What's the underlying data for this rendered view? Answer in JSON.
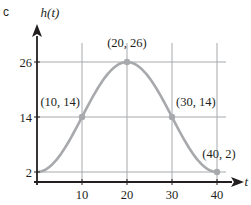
{
  "panel_label": "c",
  "chart_data": {
    "type": "line",
    "title": "",
    "xlabel": "t",
    "ylabel": "h(t)",
    "x_ticks": [
      10,
      20,
      30,
      40
    ],
    "y_ticks": [
      2,
      14,
      26
    ],
    "xlim": [
      0,
      44
    ],
    "ylim": [
      0,
      32
    ],
    "grid": true,
    "legend": null,
    "series": [
      {
        "name": "h(t)",
        "x": [
          0,
          10,
          20,
          30,
          40
        ],
        "values": [
          2,
          14,
          26,
          14,
          2
        ],
        "shape": "cosine curve, minimum at t=0 and t=40, maximum at t=20"
      }
    ],
    "marked_points": [
      {
        "x": 10,
        "y": 14,
        "label": "(10, 14)"
      },
      {
        "x": 20,
        "y": 26,
        "label": "(20, 26)"
      },
      {
        "x": 30,
        "y": 14,
        "label": "(30, 14)"
      },
      {
        "x": 40,
        "y": 2,
        "label": "(40, 2)"
      }
    ],
    "colors": {
      "curve": "#a7a9ac",
      "gridlines": "#a7a9ac",
      "axes": "#231f20",
      "text": "#231f20"
    }
  }
}
